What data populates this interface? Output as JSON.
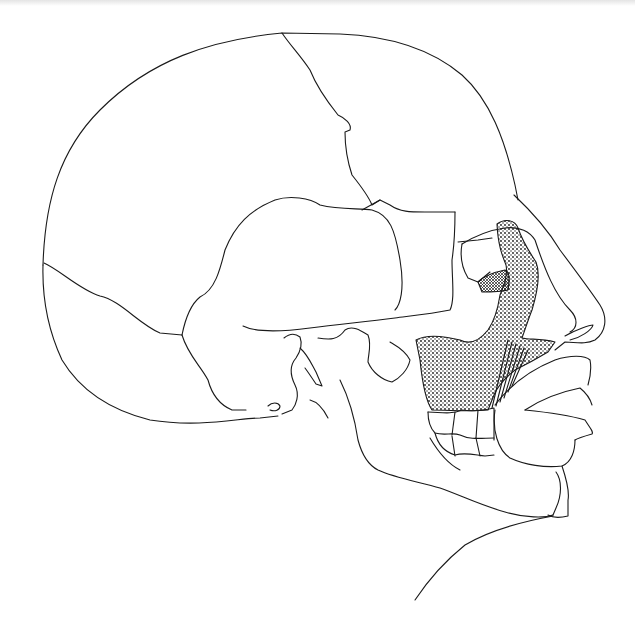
{
  "illustration": {
    "subject": "skull-lateral-view",
    "colors": {
      "background": "#ffffff",
      "line": "#1a1a1a",
      "stipple": "#1a1a1a"
    },
    "regions": [
      "cranial-vault",
      "frontal-bone",
      "parietal-bone",
      "occipital-bone",
      "temporal-squama",
      "orbit",
      "nasal-profile",
      "maxillary-sinus-stippled",
      "dentition",
      "mandible",
      "lips",
      "neck"
    ]
  }
}
